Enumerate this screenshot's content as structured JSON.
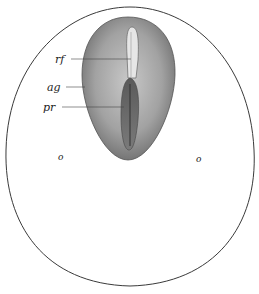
{
  "figure": {
    "labels": {
      "rf": "rf",
      "ag": "ag",
      "pr": "pr",
      "o_left": "o",
      "o_right": "o"
    },
    "colors": {
      "outline": "#3a3a3a",
      "embryo_dark": "#6e6e6e",
      "embryo_mid": "#9a9a9a",
      "embryo_light": "#c4c4c4",
      "streak": "#4a4a4a",
      "background": "#ffffff"
    }
  }
}
